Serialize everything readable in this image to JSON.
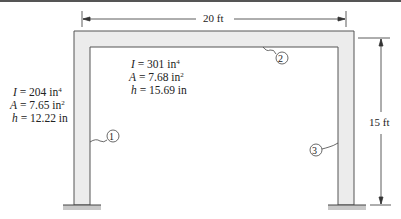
{
  "diagram": {
    "type": "portal-frame",
    "dimensions": {
      "span_label": "20 ft",
      "height_label": "15 ft"
    },
    "members": [
      {
        "id": "1",
        "label": "1",
        "role": "left-column",
        "I": "204",
        "I_unit": "in",
        "I_exp": "4",
        "A": "7.65",
        "A_unit": "in",
        "A_exp": "2",
        "h": "12.22",
        "h_unit": "in"
      },
      {
        "id": "2",
        "label": "2",
        "role": "beam",
        "I": "301",
        "I_unit": "in",
        "I_exp": "4",
        "A": "7.68",
        "A_unit": "in",
        "A_exp": "2",
        "h": "15.69",
        "h_unit": "in"
      },
      {
        "id": "3",
        "label": "3",
        "role": "right-column"
      }
    ],
    "symbols": {
      "I": "I",
      "A": "A",
      "h": "h",
      "eq": " = "
    },
    "colors": {
      "member_fill": "#ececec",
      "member_edge": "#555555",
      "support_fill": "#c8c8c8",
      "line": "#333333"
    }
  }
}
